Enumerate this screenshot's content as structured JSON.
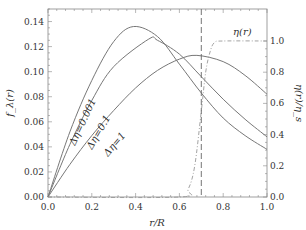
{
  "chart_data": {
    "type": "line",
    "title": "",
    "xlabel": "r/R",
    "ylabel": "f_λ(r)",
    "y2label": "η(r)/η_s",
    "xlim": [
      0.0,
      1.0
    ],
    "ylim": [
      0.0,
      0.15
    ],
    "y2lim": [
      0.0,
      1.0
    ],
    "grid": false,
    "x_ticks": [
      "0.0",
      "0.2",
      "0.4",
      "0.6",
      "0.8",
      "1.0"
    ],
    "y_ticks": [
      "0.00",
      "0.02",
      "0.04",
      "0.06",
      "0.08",
      "0.10",
      "0.12",
      "0.14"
    ],
    "y2_ticks": [
      "0.0",
      "0.2",
      "0.4",
      "0.6",
      "0.8",
      "1.0"
    ],
    "vertical_marker": {
      "x": 0.7,
      "style": "dashed"
    },
    "series": [
      {
        "name": "Δη=0.001",
        "axis": "left",
        "style": "solid",
        "x": [
          0.0,
          0.1,
          0.2,
          0.3,
          0.39,
          0.5,
          0.6,
          0.7,
          0.8,
          0.9,
          1.0
        ],
        "values": [
          0.0,
          0.052,
          0.093,
          0.124,
          0.136,
          0.128,
          0.106,
          0.083,
          0.063,
          0.049,
          0.038
        ]
      },
      {
        "name": "Δη=0.1",
        "axis": "left",
        "style": "solid",
        "x": [
          0.0,
          0.1,
          0.2,
          0.3,
          0.46,
          0.5,
          0.6,
          0.7,
          0.8,
          0.9,
          1.0
        ],
        "values": [
          0.0,
          0.042,
          0.077,
          0.104,
          0.126,
          0.125,
          0.114,
          0.096,
          0.078,
          0.062,
          0.048
        ]
      },
      {
        "name": "Δη=1",
        "axis": "left",
        "style": "solid",
        "x": [
          0.0,
          0.1,
          0.2,
          0.3,
          0.4,
          0.5,
          0.6,
          0.68,
          0.8,
          0.9,
          1.0
        ],
        "values": [
          0.0,
          0.026,
          0.049,
          0.069,
          0.087,
          0.101,
          0.11,
          0.113,
          0.108,
          0.097,
          0.082
        ]
      },
      {
        "name": "η(r)",
        "axis": "right",
        "style": "dash-dot",
        "x": [
          0.0,
          0.6,
          0.64,
          0.67,
          0.7,
          0.72,
          0.74,
          0.76,
          0.8,
          1.0
        ],
        "values": [
          0.0,
          0.0,
          0.05,
          0.2,
          0.55,
          0.8,
          0.93,
          0.99,
          1.0,
          1.0
        ]
      }
    ],
    "annotations": [
      "Δη=0.001",
      "Δη=0.1",
      "Δη=1",
      "η(r)"
    ]
  }
}
